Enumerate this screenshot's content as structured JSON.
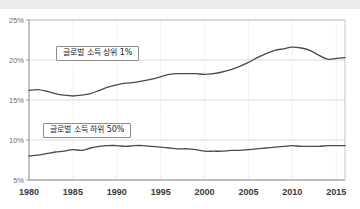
{
  "chart_data": {
    "type": "line",
    "title": "",
    "subtitle": "",
    "xlabel": "",
    "ylabel": "",
    "xlim": [
      1980,
      2016
    ],
    "ylim": [
      5,
      25
    ],
    "grid": true,
    "legend_position": "inline-callout",
    "y_ticks": [
      "5%",
      "10%",
      "15%",
      "20%",
      "25%"
    ],
    "y_tick_values": [
      5,
      10,
      15,
      20,
      25
    ],
    "x_ticks": [
      "1980",
      "1985",
      "1990",
      "1995",
      "2000",
      "2005",
      "2010",
      "2015"
    ],
    "x_tick_values": [
      1980,
      1985,
      1990,
      1995,
      2000,
      2005,
      2010,
      2015
    ],
    "line_color": "#4a4a4a",
    "grid_color": "#dcdcdc",
    "axis_color": "#9a9a9a",
    "background": "#ffffff",
    "series": [
      {
        "name": "글로벌 소득 상위 1%",
        "label_position": {
          "x": 56,
          "y": 46
        },
        "x": [
          1980,
          1981,
          1982,
          1983,
          1984,
          1985,
          1986,
          1987,
          1988,
          1989,
          1990,
          1991,
          1992,
          1993,
          1994,
          1995,
          1996,
          1997,
          1998,
          1999,
          2000,
          2001,
          2002,
          2003,
          2004,
          2005,
          2006,
          2007,
          2008,
          2009,
          2010,
          2011,
          2012,
          2013,
          2014,
          2015,
          2016
        ],
        "values": [
          16.2,
          16.3,
          16.1,
          15.8,
          15.6,
          15.5,
          15.6,
          15.8,
          16.2,
          16.6,
          16.9,
          17.1,
          17.2,
          17.4,
          17.6,
          17.9,
          18.2,
          18.3,
          18.3,
          18.3,
          18.2,
          18.3,
          18.5,
          18.8,
          19.2,
          19.7,
          20.3,
          20.8,
          21.2,
          21.4,
          21.6,
          21.5,
          21.2,
          20.6,
          20.1,
          20.2,
          20.3
        ]
      },
      {
        "name": "글로벌 소득 하위 50%",
        "label_position": {
          "x": 43,
          "y": 123
        },
        "x": [
          1980,
          1981,
          1982,
          1983,
          1984,
          1985,
          1986,
          1987,
          1988,
          1989,
          1990,
          1991,
          1992,
          1993,
          1994,
          1995,
          1996,
          1997,
          1998,
          1999,
          2000,
          2001,
          2002,
          2003,
          2004,
          2005,
          2006,
          2007,
          2008,
          2009,
          2010,
          2011,
          2012,
          2013,
          2014,
          2015,
          2016
        ],
        "values": [
          8.0,
          8.1,
          8.3,
          8.5,
          8.6,
          8.8,
          8.7,
          9.0,
          9.2,
          9.3,
          9.3,
          9.2,
          9.3,
          9.3,
          9.2,
          9.1,
          9.0,
          8.9,
          8.9,
          8.8,
          8.6,
          8.6,
          8.6,
          8.7,
          8.7,
          8.8,
          8.9,
          9.0,
          9.1,
          9.2,
          9.3,
          9.2,
          9.2,
          9.2,
          9.3,
          9.3,
          9.3
        ]
      }
    ]
  },
  "callouts": {
    "top_series_label": "글로벌 소득 상위 1%",
    "bottom_series_label": "글로벌 소득 하위 50%"
  }
}
